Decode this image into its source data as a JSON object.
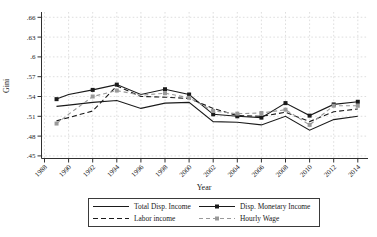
{
  "chart_data": {
    "type": "line",
    "title": "",
    "xlabel": "Year",
    "ylabel": "Gini",
    "x": [
      1989,
      1990,
      1992,
      1994,
      1996,
      1998,
      2000,
      2002,
      2004,
      2006,
      2008,
      2010,
      2012,
      2014
    ],
    "xtick_years": [
      1988,
      1990,
      1992,
      1994,
      1996,
      1998,
      2000,
      2002,
      2004,
      2006,
      2008,
      2010,
      2012,
      2014
    ],
    "xtick_labels": [
      "1988",
      "1990",
      "1992",
      "1994",
      "1996",
      "1998",
      "2000",
      "2002",
      "2004",
      "2006",
      "2008",
      "2010",
      "2012",
      "2014"
    ],
    "ytick_values": [
      0.66,
      0.63,
      0.6,
      0.57,
      0.54,
      0.51,
      0.48,
      0.45
    ],
    "ytick_labels": [
      ".66",
      ".63",
      ".6",
      ".57",
      ".54",
      ".51",
      ".48",
      ".45"
    ],
    "ylim": [
      0.45,
      0.66
    ],
    "xlim": [
      1988,
      2014
    ],
    "grid": "both-dashed",
    "legend_position": "bottom-box",
    "marker_years": [
      1989,
      1992,
      1994,
      1998,
      2000,
      2002,
      2004,
      2006,
      2008,
      2010,
      2012,
      2014
    ],
    "series": [
      {
        "name": "Total Disp. Income",
        "color": "#1a1a1a",
        "dash": "solid",
        "marker": "none",
        "values": [
          0.525,
          0.527,
          0.531,
          0.534,
          0.522,
          0.53,
          0.531,
          0.502,
          0.501,
          0.497,
          0.51,
          0.489,
          0.505,
          0.51
        ]
      },
      {
        "name": "Disp. Monetary Income",
        "color": "#1a1a1a",
        "dash": "solid",
        "marker": "square",
        "values": [
          0.536,
          0.543,
          0.55,
          0.558,
          0.543,
          0.551,
          0.543,
          0.513,
          0.51,
          0.508,
          0.53,
          0.511,
          0.528,
          0.532
        ]
      },
      {
        "name": "Labor income",
        "color": "#1a1a1a",
        "dash": "dashed",
        "marker": "none",
        "values": [
          0.503,
          0.508,
          0.518,
          0.556,
          0.54,
          0.539,
          0.537,
          0.522,
          0.511,
          0.51,
          0.516,
          0.502,
          0.517,
          0.521
        ]
      },
      {
        "name": "Hourly Wage",
        "color": "#999999",
        "dash": "dashed",
        "marker": "square",
        "values": [
          0.499,
          0.513,
          0.54,
          0.549,
          0.542,
          0.545,
          0.538,
          0.518,
          0.514,
          0.515,
          0.52,
          0.497,
          0.526,
          0.526
        ]
      }
    ],
    "colors": {
      "grid": "#d6d6d6",
      "axis": "#303030",
      "text": "#1a1a1a",
      "background": "#ffffff"
    }
  },
  "legend": {
    "items": [
      {
        "label": "Total Disp. Income",
        "series": 0
      },
      {
        "label": "Disp. Monetary Income",
        "series": 1
      },
      {
        "label": "Labor income",
        "series": 2
      },
      {
        "label": "Hourly Wage",
        "series": 3
      }
    ]
  }
}
